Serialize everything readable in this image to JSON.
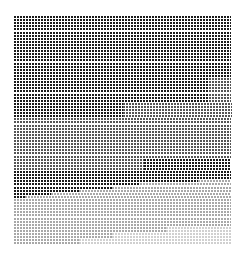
{
  "caption": {
    "text": ""
  },
  "grid": {
    "cols": 72,
    "rows": 74,
    "row_pitch_px": 3.1,
    "col_pitch_px": 3.0,
    "colors": {
      "dark": "#1a1a1a",
      "mid": "#555555",
      "light": "#a8a8a8",
      "faint": "#d0d0d0",
      "gap": "#ffffff"
    },
    "bands": [
      {
        "from_row": 0,
        "to_row": 20,
        "segments": [
          {
            "tone": "dark",
            "until": 1.0
          }
        ]
      },
      {
        "from_row": 20,
        "to_row": 28,
        "segments": [
          {
            "tone": "dark",
            "until": 0.9
          },
          {
            "tone": "mid",
            "until": 1.0
          }
        ]
      },
      {
        "from_row": 28,
        "to_row": 33,
        "segments": [
          {
            "tone": "dark",
            "until": 0.5
          },
          {
            "tone": "mid",
            "until": 1.0
          }
        ]
      },
      {
        "from_row": 33,
        "to_row": 46,
        "segments": [
          {
            "tone": "mid",
            "until": 1.0
          }
        ]
      },
      {
        "from_row": 46,
        "to_row": 50,
        "segments": [
          {
            "tone": "mid",
            "until": 0.6
          },
          {
            "tone": "dark",
            "until": 1.0
          }
        ]
      },
      {
        "from_row": 50,
        "to_row": 53,
        "segments": [
          {
            "tone": "dark",
            "until": 1.0
          }
        ]
      },
      {
        "from_row": 53,
        "to_row": 54,
        "segments": [
          {
            "tone": "dark",
            "until": 0.85
          },
          {
            "tone": "light",
            "until": 1.0
          }
        ]
      },
      {
        "from_row": 54,
        "to_row": 55,
        "segments": [
          {
            "tone": "dark",
            "until": 0.58
          },
          {
            "tone": "light",
            "until": 1.0
          }
        ]
      },
      {
        "from_row": 55,
        "to_row": 56,
        "segments": [
          {
            "tone": "dark",
            "until": 0.45
          },
          {
            "tone": "light",
            "until": 1.0
          }
        ]
      },
      {
        "from_row": 56,
        "to_row": 57,
        "segments": [
          {
            "tone": "dark",
            "until": 0.3
          },
          {
            "tone": "light",
            "until": 1.0
          }
        ]
      },
      {
        "from_row": 57,
        "to_row": 58,
        "segments": [
          {
            "tone": "dark",
            "until": 0.17
          },
          {
            "tone": "light",
            "until": 1.0
          }
        ]
      },
      {
        "from_row": 58,
        "to_row": 59,
        "segments": [
          {
            "tone": "dark",
            "until": 0.05
          },
          {
            "tone": "light",
            "until": 1.0
          }
        ]
      },
      {
        "from_row": 59,
        "to_row": 68,
        "segments": [
          {
            "tone": "light",
            "until": 1.0
          }
        ]
      },
      {
        "from_row": 68,
        "to_row": 70,
        "segments": [
          {
            "tone": "light",
            "until": 0.7
          },
          {
            "tone": "faint",
            "until": 1.0
          }
        ]
      },
      {
        "from_row": 70,
        "to_row": 72,
        "segments": [
          {
            "tone": "light",
            "until": 0.45
          },
          {
            "tone": "faint",
            "until": 1.0
          }
        ]
      },
      {
        "from_row": 72,
        "to_row": 74,
        "segments": [
          {
            "tone": "light",
            "until": 0.3
          },
          {
            "tone": "faint",
            "until": 1.0
          }
        ]
      }
    ]
  }
}
